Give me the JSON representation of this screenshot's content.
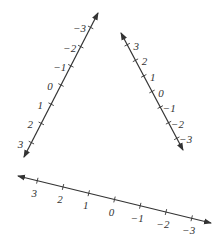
{
  "diagram": {
    "number_lines": [
      {
        "id": "left",
        "start": [
          24,
          157
        ],
        "end": [
          98,
          13
        ],
        "labels": [
          "3",
          "2",
          "1",
          "0",
          "−1",
          "−2",
          "−3"
        ],
        "label_side": "left"
      },
      {
        "id": "right",
        "start": [
          121,
          33
        ],
        "end": [
          183,
          150
        ],
        "labels": [
          "3",
          "2",
          "1",
          "0",
          "−1",
          "−2",
          "−3"
        ],
        "label_side": "right"
      },
      {
        "id": "bottom",
        "start": [
          18,
          176
        ],
        "end": [
          211,
          223
        ],
        "labels": [
          "3",
          "2",
          "1",
          "0",
          "−1",
          "−2",
          "−3"
        ],
        "label_side": "below"
      }
    ],
    "colors": {
      "line": "#333333",
      "text": "#333333",
      "background": "#ffffff"
    }
  }
}
